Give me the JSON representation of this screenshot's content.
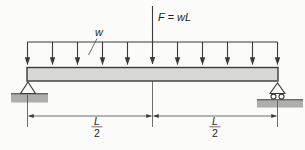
{
  "labels": {
    "distributed_load": "w",
    "point_load": "F = wL",
    "dim_left": {
      "numerator": "L",
      "denominator": "2"
    },
    "dim_right": {
      "numerator": "L",
      "denominator": "2"
    }
  },
  "diagram": {
    "type": "simply-supported-beam-load-diagram",
    "beam": "horizontal beam",
    "left_support": "pin-support",
    "right_support": "roller-support",
    "distributed_load_arrow_count": 11,
    "point_load_position": "midspan"
  },
  "colors": {
    "background": "#fbfbfa",
    "line": "#3a3a3a",
    "beam_fill": "#d8d8d6",
    "ground_fill": "#aeaeac"
  }
}
